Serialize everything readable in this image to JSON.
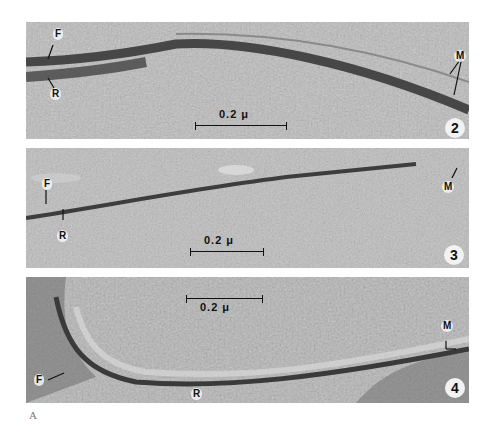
{
  "figure": {
    "plate_label": "A",
    "panels": [
      {
        "number": "2",
        "labels": {
          "f": "F",
          "r": "R",
          "m": "M"
        },
        "scale_bar": "0.2 μ"
      },
      {
        "number": "3",
        "labels": {
          "f": "F",
          "r": "R",
          "m": "M"
        },
        "scale_bar": "0.2 μ"
      },
      {
        "number": "4",
        "labels": {
          "f": "F",
          "r": "R",
          "m": "M"
        },
        "scale_bar": "0.2 μ"
      }
    ],
    "colors": {
      "background": "#b9b9b9",
      "membrane": "#3a3a3a",
      "label_bg": "#f2f2f2"
    }
  }
}
